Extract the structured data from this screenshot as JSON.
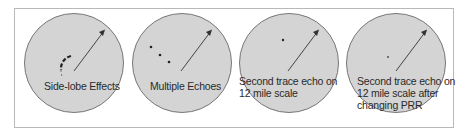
{
  "figure": {
    "panels": [
      {
        "id": "side-lobe",
        "label_lines": [
          "Side-lobe Effects"
        ],
        "echo_type": "arc"
      },
      {
        "id": "multiple-echoes",
        "label_lines": [
          "Multiple Echoes"
        ],
        "echo_type": "dots-3"
      },
      {
        "id": "second-trace",
        "label_lines": [
          "Second trace echo on",
          "12 mile scale"
        ],
        "echo_type": "dot-1"
      },
      {
        "id": "second-trace-prr",
        "label_lines": [
          "Second trace echo on",
          "12 mile scale after",
          "changing PRR"
        ],
        "echo_type": "dot-faint"
      }
    ],
    "colors": {
      "scope_fill": "#d4d4d4",
      "scope_stroke": "#777777",
      "frame": "#b8b8b8",
      "arrow": "#333333",
      "text": "#2a2a2a"
    }
  }
}
